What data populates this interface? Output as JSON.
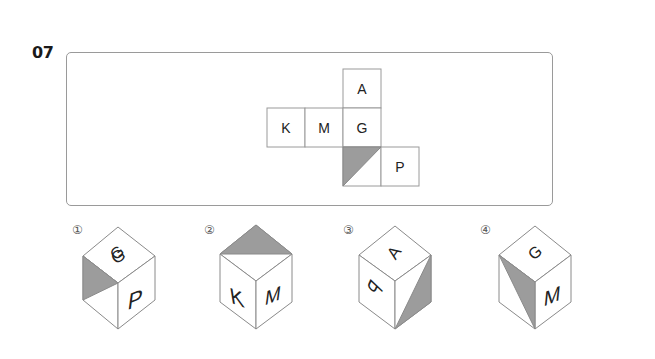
{
  "question": {
    "number": "07"
  },
  "net": {
    "cells": [
      {
        "id": "top",
        "label": "A",
        "col": 2,
        "row": 0
      },
      {
        "id": "left2",
        "label": "K",
        "col": 0,
        "row": 1
      },
      {
        "id": "left1",
        "label": "M",
        "col": 1,
        "row": 1
      },
      {
        "id": "center",
        "label": "G",
        "col": 2,
        "row": 1
      },
      {
        "id": "shaded",
        "label": "",
        "col": 2,
        "row": 2,
        "shading": "upper-left triangle"
      },
      {
        "id": "right",
        "label": "P",
        "col": 3,
        "row": 2
      }
    ],
    "shade_color": "#9c9c9c",
    "line_color": "#9a9a9a"
  },
  "options": [
    {
      "number": "①",
      "top": "G",
      "left": "",
      "right": "P",
      "shading": "left face upper triangle"
    },
    {
      "number": "②",
      "top": "",
      "left": "K",
      "right": "M",
      "shading": "top face back half"
    },
    {
      "number": "③",
      "top": "A",
      "left": "P",
      "right": "",
      "shading": "right face lower triangle"
    },
    {
      "number": "④",
      "top": "G",
      "left": "",
      "right": "M",
      "shading": "left face diagonal triangle"
    }
  ]
}
